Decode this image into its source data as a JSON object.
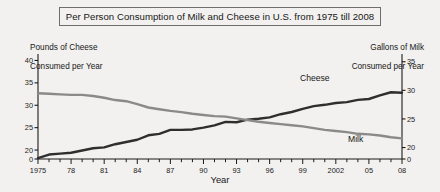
{
  "title": "Per Person Consumption of Milk and Cheese in U.S. from 1975 till 2008",
  "axes": {
    "left_caption_line1": "Pounds of Cheese",
    "left_caption_line2": "Consumed per Year",
    "right_caption_line1": "Gallons of Milk",
    "right_caption_line2": "Consumed per Year",
    "xlabel": "Year"
  },
  "labels": {
    "cheese": "Cheese",
    "milk": "Milk"
  },
  "colors": {
    "cheese": "#2e2e2e",
    "milk": "#8a8a8a",
    "background": "#f2f1ef",
    "axis": "#1a1a1a",
    "title_border": "#6e6e6e"
  },
  "chart_data": {
    "type": "line",
    "title": "Per Person Consumption of Milk and Cheese in U.S. from 1975 till 2008",
    "xlabel": "Year",
    "ylabel": "Pounds of Cheese Consumed per Year",
    "y2label": "Gallons of Milk Consumed per Year",
    "grid": false,
    "legend": "inline-annotations",
    "x": [
      1975,
      1976,
      1977,
      1978,
      1979,
      1980,
      1981,
      1982,
      1983,
      1984,
      1985,
      1986,
      1987,
      1988,
      1989,
      1990,
      1991,
      1992,
      1993,
      1994,
      1995,
      1996,
      1997,
      1998,
      1999,
      2000,
      2001,
      2002,
      2003,
      2004,
      2005,
      2006,
      2007,
      2008
    ],
    "xtick_labels": [
      "1975",
      "78",
      "81",
      "84",
      "87",
      "90",
      "93",
      "96",
      "99",
      "2002",
      "05",
      "08"
    ],
    "xtick_values": [
      1975,
      1978,
      1981,
      1984,
      1987,
      1990,
      1993,
      1996,
      1999,
      2002,
      2005,
      2008
    ],
    "ylim": [
      18,
      41
    ],
    "ytick_labels": [
      "0",
      "20",
      "25",
      "30",
      "35",
      "40"
    ],
    "ytick_values": [
      18,
      20,
      25,
      30,
      35,
      40
    ],
    "y2lim": [
      18,
      36
    ],
    "y2tick_labels": [
      "0",
      "20",
      "25",
      "30",
      "35"
    ],
    "y2tick_values": [
      18,
      20,
      25,
      30,
      35
    ],
    "axis_break": true,
    "series": [
      {
        "name": "Cheese",
        "axis": "left",
        "units": "pounds per person per year",
        "color": "#2e2e2e",
        "values": [
          18.2,
          19.0,
          19.2,
          19.4,
          19.9,
          20.4,
          20.6,
          21.3,
          21.8,
          22.3,
          23.3,
          23.6,
          24.5,
          24.5,
          24.6,
          25.0,
          25.5,
          26.3,
          26.2,
          26.8,
          27.0,
          27.3,
          28.0,
          28.5,
          29.2,
          29.8,
          30.1,
          30.5,
          30.7,
          31.2,
          31.4,
          32.2,
          32.9,
          32.8
        ]
      },
      {
        "name": "Milk",
        "axis": "right",
        "units": "gallons per person per year",
        "color": "#8a8a8a",
        "values": [
          29.5,
          29.4,
          29.3,
          29.2,
          29.2,
          29.0,
          28.7,
          28.3,
          28.1,
          27.6,
          27.0,
          26.7,
          26.4,
          26.2,
          25.9,
          25.7,
          25.5,
          25.4,
          25.1,
          24.8,
          24.5,
          24.3,
          24.1,
          23.9,
          23.7,
          23.4,
          23.1,
          22.9,
          22.7,
          22.4,
          22.3,
          22.1,
          21.8,
          21.6
        ]
      }
    ]
  }
}
